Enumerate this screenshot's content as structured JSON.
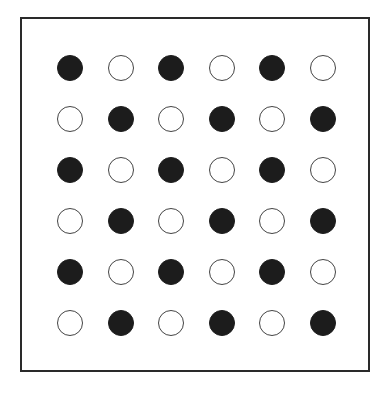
{
  "diagram": {
    "type": "dot-grid",
    "rows": 6,
    "cols": 6,
    "origin": [
      70,
      68
    ],
    "spacing": [
      50.5,
      51
    ],
    "radius": 13,
    "colors": {
      "filled": "#1c1c1c",
      "empty_stroke": "#444444",
      "frame": "#2a2a2a"
    },
    "grid": [
      [
        "filled",
        "empty",
        "filled",
        "empty",
        "filled",
        "empty"
      ],
      [
        "empty",
        "filled",
        "empty",
        "filled",
        "empty",
        "filled"
      ],
      [
        "filled",
        "empty",
        "filled",
        "empty",
        "filled",
        "empty"
      ],
      [
        "empty",
        "filled",
        "empty",
        "filled",
        "empty",
        "filled"
      ],
      [
        "filled",
        "empty",
        "filled",
        "empty",
        "filled",
        "empty"
      ],
      [
        "empty",
        "filled",
        "empty",
        "filled",
        "empty",
        "filled"
      ]
    ]
  }
}
